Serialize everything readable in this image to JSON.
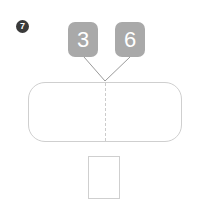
{
  "question": {
    "number": "7"
  },
  "tiles": [
    {
      "value": "3",
      "name": "part-tile-1"
    },
    {
      "value": "6",
      "name": "part-tile-2"
    }
  ],
  "bar_model": {
    "label": "",
    "left_part_label": "",
    "right_part_label": ""
  },
  "answer": {
    "value": "",
    "placeholder": ""
  },
  "colors": {
    "tile_fill": "#a9a9a9",
    "tile_text": "#ffffff",
    "badge_fill": "#3a3a3a",
    "badge_text": "#ffffff",
    "outline": "#cfcfcf",
    "divider": "#cccccc",
    "connector": "#9a9a9a",
    "background": "#ffffff"
  }
}
